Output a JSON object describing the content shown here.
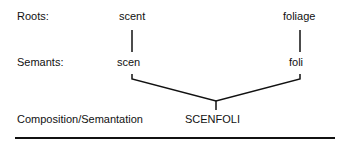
{
  "labels": {
    "roots": "Roots:",
    "semants": "Semants:",
    "composition": "Composition/Semantation"
  },
  "roots": [
    "scent",
    "foliage"
  ],
  "semants": [
    "scen",
    "foli"
  ],
  "result": "SCENFOLI"
}
